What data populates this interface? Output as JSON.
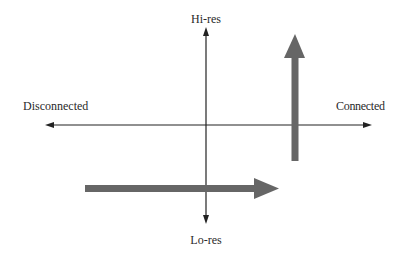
{
  "diagram": {
    "axes": {
      "top_label": "Hi-res",
      "bottom_label": "Lo-res",
      "left_label": "Disconnected",
      "right_label": "Connected",
      "line_color": "#222222"
    },
    "arrows": [
      {
        "name": "horizontal-trend-arrow",
        "direction": "right",
        "color": "#666666"
      },
      {
        "name": "vertical-trend-arrow",
        "direction": "up",
        "color": "#666666"
      }
    ]
  }
}
